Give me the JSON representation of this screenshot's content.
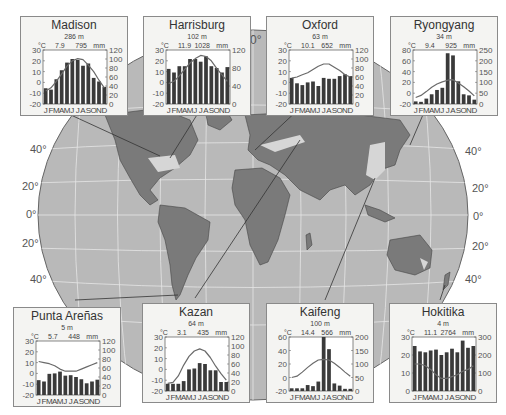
{
  "figure": {
    "latitude_labels_left": [
      "40°",
      "20°",
      "0°",
      "20°",
      "40°"
    ],
    "latitude_labels_right": [
      "40°",
      "20°",
      "0°",
      "20°",
      "40°"
    ],
    "equator_label_top": "0°",
    "colors": {
      "ocean": "#b9b9b9",
      "land": "#7a7a7a",
      "desert": "#d6d6d6",
      "grid": "#e8e8e8",
      "bar": "#3a3a3a",
      "temp_line": "#6a6a6a",
      "box_bg": "#f4f4f2"
    }
  },
  "chart_data": [
    {
      "type": "bar+line",
      "title": "Madison",
      "elevation": "286 m",
      "mean_temp": "7.9",
      "annual_precip": "795",
      "temp_unit": "°C",
      "precip_unit": "mm",
      "categories": [
        "J",
        "F",
        "M",
        "A",
        "M",
        "J",
        "J",
        "A",
        "S",
        "O",
        "N",
        "D"
      ],
      "temp_ticks": [
        30,
        20,
        10,
        0,
        -10,
        -20
      ],
      "precip_ticks": [
        120,
        100,
        80,
        60,
        40,
        20,
        0
      ],
      "temp_range": [
        -20,
        30
      ],
      "precip_range": [
        0,
        120
      ],
      "temperature": [
        -8,
        -5,
        1,
        8,
        15,
        20,
        22,
        21,
        16,
        10,
        2,
        -5
      ],
      "precipitation": [
        35,
        32,
        55,
        75,
        92,
        100,
        98,
        85,
        90,
        58,
        50,
        38
      ]
    },
    {
      "type": "bar+line",
      "title": "Harrisburg",
      "elevation": "102 m",
      "mean_temp": "11.9",
      "annual_precip": "1028",
      "temp_unit": "°C",
      "precip_unit": "mm",
      "categories": [
        "J",
        "F",
        "M",
        "A",
        "M",
        "J",
        "J",
        "A",
        "S",
        "O",
        "N",
        "D"
      ],
      "temp_ticks": [
        30,
        20,
        10,
        0,
        -10,
        -20
      ],
      "precip_ticks": [
        120,
        80,
        40,
        0
      ],
      "temp_range": [
        -20,
        30
      ],
      "precip_range": [
        0,
        120
      ],
      "temperature": [
        -1,
        1,
        6,
        12,
        18,
        22,
        25,
        24,
        20,
        13,
        7,
        1
      ],
      "precipitation": [
        78,
        70,
        84,
        84,
        100,
        100,
        94,
        106,
        84,
        80,
        70,
        82
      ]
    },
    {
      "type": "bar+line",
      "title": "Oxford",
      "elevation": "63 m",
      "mean_temp": "10.1",
      "annual_precip": "652",
      "temp_unit": "°C",
      "precip_unit": "mm",
      "categories": [
        "J",
        "F",
        "M",
        "A",
        "M",
        "J",
        "J",
        "A",
        "S",
        "O",
        "N",
        "D"
      ],
      "temp_ticks": [
        30,
        20,
        10,
        0,
        -10,
        -20
      ],
      "precip_ticks": [
        120,
        100,
        80,
        60,
        40,
        20,
        0
      ],
      "temp_range": [
        -20,
        30
      ],
      "precip_range": [
        0,
        120
      ],
      "temperature": [
        4,
        5,
        7,
        9,
        12,
        15,
        17,
        17,
        14,
        11,
        7,
        5
      ],
      "precipitation": [
        58,
        46,
        42,
        48,
        50,
        40,
        58,
        56,
        56,
        62,
        66,
        62
      ]
    },
    {
      "type": "bar+line",
      "title": "Ryongyang",
      "elevation": "34 m",
      "mean_temp": "9.4",
      "annual_precip": "925",
      "temp_unit": "°C",
      "precip_unit": "mm",
      "categories": [
        "J",
        "F",
        "M",
        "A",
        "M",
        "J",
        "J",
        "A",
        "S",
        "O",
        "N",
        "D"
      ],
      "temp_ticks": [
        80,
        60,
        40,
        20,
        0,
        -20
      ],
      "precip_ticks": [
        250,
        200,
        150,
        100,
        50,
        0
      ],
      "temp_range": [
        -20,
        80
      ],
      "precip_range": [
        0,
        250
      ],
      "temperature": [
        -8,
        -4,
        3,
        11,
        17,
        21,
        24,
        25,
        19,
        12,
        4,
        -5
      ],
      "precipitation": [
        12,
        10,
        25,
        45,
        65,
        75,
        235,
        225,
        105,
        45,
        40,
        20
      ]
    },
    {
      "type": "bar+line",
      "title": "Punta Areñas",
      "elevation": "5 m",
      "mean_temp": "5.7",
      "annual_precip": "448",
      "temp_unit": "°C",
      "precip_unit": "mm",
      "categories": [
        "J",
        "F",
        "M",
        "A",
        "M",
        "J",
        "J",
        "A",
        "S",
        "O",
        "N",
        "D"
      ],
      "temp_ticks": [
        30,
        20,
        10,
        0,
        -10,
        -20
      ],
      "precip_ticks": [
        120,
        100,
        80,
        60,
        40,
        20,
        0
      ],
      "temp_range": [
        -20,
        30
      ],
      "precip_range": [
        0,
        120
      ],
      "temperature": [
        11,
        10,
        9,
        7,
        4,
        2,
        2,
        2,
        4,
        6,
        8,
        10
      ],
      "precipitation": [
        33,
        30,
        47,
        48,
        52,
        43,
        44,
        40,
        35,
        26,
        30,
        34
      ]
    },
    {
      "type": "bar+line",
      "title": "Kazan",
      "elevation": "64 m",
      "mean_temp": "3.1",
      "annual_precip": "435",
      "temp_unit": "°C",
      "precip_unit": "mm",
      "categories": [
        "J",
        "F",
        "M",
        "A",
        "M",
        "J",
        "J",
        "A",
        "S",
        "O",
        "N",
        "D"
      ],
      "temp_ticks": [
        30,
        20,
        10,
        0,
        -10,
        -20
      ],
      "precip_ticks": [
        120,
        100,
        80,
        60,
        40,
        20,
        0
      ],
      "temp_range": [
        -20,
        30
      ],
      "precip_range": [
        0,
        120
      ],
      "temperature": [
        -13,
        -12,
        -6,
        4,
        12,
        17,
        19,
        17,
        11,
        3,
        -4,
        -10
      ],
      "precipitation": [
        16,
        16,
        16,
        22,
        48,
        50,
        62,
        60,
        46,
        46,
        20,
        20
      ]
    },
    {
      "type": "bar+line",
      "title": "Kaifeng",
      "elevation": "100 m",
      "mean_temp": "14.4",
      "annual_precip": "566",
      "temp_unit": "°C",
      "precip_unit": "mm",
      "categories": [
        "J",
        "F",
        "M",
        "A",
        "M",
        "J",
        "J",
        "A",
        "S",
        "O",
        "N",
        "D"
      ],
      "temp_ticks": [
        60,
        40,
        20,
        0,
        -20
      ],
      "precip_ticks": [
        200,
        150,
        100,
        50,
        0
      ],
      "temp_range": [
        -20,
        60
      ],
      "precip_range": [
        0,
        200
      ],
      "temperature": [
        0,
        2,
        8,
        15,
        21,
        26,
        27,
        26,
        21,
        15,
        8,
        2
      ],
      "precipitation": [
        10,
        10,
        10,
        22,
        18,
        35,
        200,
        155,
        28,
        20,
        8,
        8
      ]
    },
    {
      "type": "bar+line",
      "title": "Hokitika",
      "elevation": "4 m",
      "mean_temp": "11.1",
      "annual_precip": "2764",
      "temp_unit": "°C",
      "precip_unit": "mm",
      "categories": [
        "J",
        "F",
        "M",
        "A",
        "M",
        "J",
        "J",
        "A",
        "S",
        "O",
        "N",
        "D"
      ],
      "temp_ticks": [
        30,
        20,
        10,
        0
      ],
      "precip_ticks": [
        300,
        200,
        100,
        0
      ],
      "temp_range": [
        0,
        30
      ],
      "precip_range": [
        0,
        300
      ],
      "temperature": [
        15,
        15,
        14,
        12,
        9,
        7,
        7,
        8,
        9,
        11,
        12,
        14
      ],
      "precipitation": [
        250,
        220,
        215,
        225,
        230,
        200,
        215,
        235,
        215,
        280,
        240,
        250
      ]
    }
  ]
}
